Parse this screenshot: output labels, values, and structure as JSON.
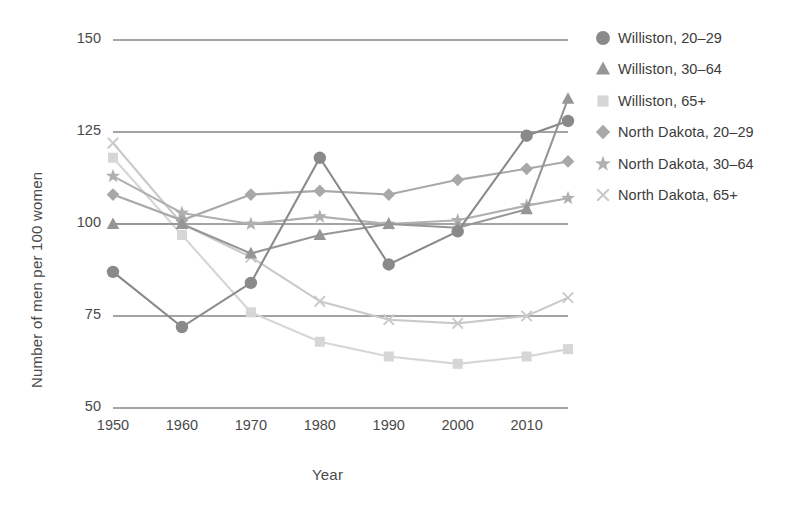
{
  "chart_data": {
    "type": "line",
    "title": "",
    "xlabel": "Year",
    "ylabel": "Number of men per 100 women",
    "x": [
      1950,
      1960,
      1970,
      1980,
      1990,
      2000,
      2010,
      2016
    ],
    "xticks": [
      "1950",
      "1960",
      "1970",
      "1980",
      "1990",
      "2000",
      "2010"
    ],
    "xtick_values": [
      1950,
      1960,
      1970,
      1980,
      1990,
      2000,
      2010
    ],
    "yticks": [
      "50",
      "75",
      "100",
      "125",
      "150"
    ],
    "ytick_values": [
      50,
      75,
      100,
      125,
      150
    ],
    "xlim": [
      1950,
      2016
    ],
    "ylim": [
      50,
      150
    ],
    "grid": "horizontal",
    "legend_position": "right",
    "series": [
      {
        "name": "Williston, 20–29",
        "marker": "circle",
        "color": "#8a8a8a",
        "values": [
          87,
          72,
          84,
          118,
          89,
          98,
          124,
          128
        ]
      },
      {
        "name": "Williston, 30–64",
        "marker": "triangle",
        "color": "#969696",
        "values": [
          100,
          100,
          92,
          97,
          100,
          99,
          104,
          134
        ]
      },
      {
        "name": "Williston, 65+",
        "marker": "square",
        "color": "#d6d6d6",
        "values": [
          118,
          97,
          76,
          68,
          64,
          62,
          64,
          66
        ]
      },
      {
        "name": "North Dakota, 20–29",
        "marker": "diamond",
        "color": "#a8a8a8",
        "values": [
          108,
          101,
          108,
          109,
          108,
          112,
          115,
          117
        ]
      },
      {
        "name": "North Dakota, 30–64",
        "marker": "star",
        "color": "#b0b0b0",
        "values": [
          113,
          103,
          100,
          102,
          100,
          101,
          105,
          107
        ]
      },
      {
        "name": "North Dakota, 65+",
        "marker": "cross",
        "color": "#c9c9c9",
        "values": [
          122,
          100,
          91,
          79,
          74,
          73,
          75,
          80
        ]
      }
    ]
  },
  "legend": {
    "items": [
      {
        "label": "Williston, 20–29",
        "marker": "circle"
      },
      {
        "label": "Williston, 30–64",
        "marker": "triangle"
      },
      {
        "label": "Williston, 65+",
        "marker": "square"
      },
      {
        "label": "North Dakota, 20–29",
        "marker": "diamond"
      },
      {
        "label": "North Dakota, 30–64",
        "marker": "star"
      },
      {
        "label": "North Dakota, 65+",
        "marker": "cross"
      }
    ]
  }
}
